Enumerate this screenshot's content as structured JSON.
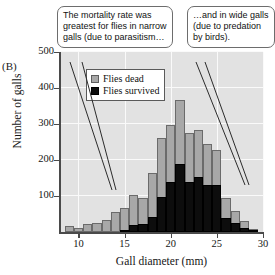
{
  "panel": {
    "letter": "(B)"
  },
  "chart_data": {
    "type": "bar",
    "title": "",
    "xlabel": "Gall diameter (mm)",
    "ylabel": "Number of galls",
    "xlim": [
      8,
      30
    ],
    "ylim": [
      0,
      500
    ],
    "xticks": [
      10,
      15,
      20,
      25,
      30
    ],
    "yticks": [
      100,
      200,
      300,
      400,
      500
    ],
    "grid": true,
    "stacked": true,
    "bin_width_mm": 1,
    "bin_centers": [
      9,
      10,
      11,
      12,
      13,
      14,
      15,
      16,
      17,
      18,
      19,
      20,
      21,
      22,
      23,
      24,
      25,
      26,
      27,
      28,
      29
    ],
    "series": [
      {
        "name": "Flies dead",
        "color": "#a8a8a8",
        "note": "gray portion = total bar height (dead + survived)",
        "values": [
          18,
          10,
          22,
          26,
          33,
          55,
          68,
          104,
          95,
          165,
          262,
          296,
          367,
          275,
          283,
          244,
          229,
          95,
          58,
          30,
          8
        ]
      },
      {
        "name": "Flies survived",
        "color": "#0d0d0d",
        "note": "black portion, measured from baseline",
        "values": [
          0,
          0,
          0,
          0,
          0,
          0,
          6,
          20,
          22,
          42,
          96,
          140,
          189,
          140,
          152,
          131,
          131,
          40,
          25,
          12,
          4
        ]
      }
    ],
    "legend": {
      "position": "upper-left-inside",
      "entries": [
        "Flies dead",
        "Flies survived"
      ]
    }
  },
  "legend": {
    "items": [
      {
        "label": "Flies dead",
        "swatch": "gray-square-icon"
      },
      {
        "label": "Flies survived",
        "swatch": "black-square-icon"
      }
    ]
  },
  "callouts": [
    {
      "id": "left",
      "text": "The mortality rate was greatest for flies in narrow galls (due to parasitism…"
    },
    {
      "id": "right",
      "text": "…and in wide galls (due to predation by birds)."
    }
  ]
}
